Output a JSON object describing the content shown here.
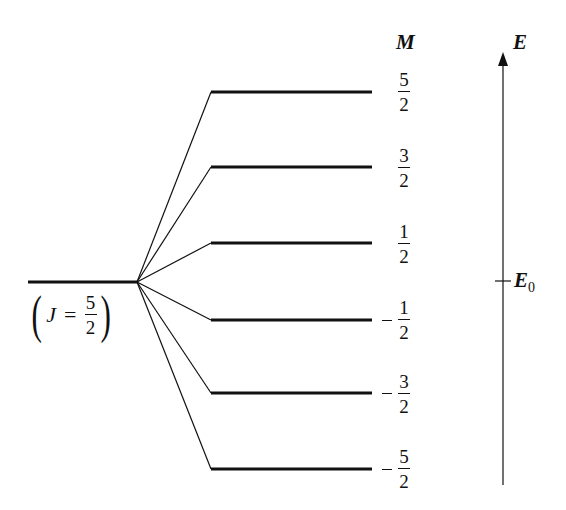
{
  "diagram": {
    "type": "energy-level-splitting",
    "colors": {
      "ink": "#111111",
      "background": "#ffffff"
    },
    "unsplit_level": {
      "label_symbol": "J",
      "label_equals": "=",
      "label_value": {
        "numerator": "5",
        "denominator": "2"
      }
    },
    "column_header": "M",
    "levels": [
      {
        "sign": "",
        "numerator": "5",
        "denominator": "2",
        "y": 92
      },
      {
        "sign": "",
        "numerator": "3",
        "denominator": "2",
        "y": 167
      },
      {
        "sign": "",
        "numerator": "1",
        "denominator": "2",
        "y": 243
      },
      {
        "sign": "−",
        "numerator": "1",
        "denominator": "2",
        "y": 320
      },
      {
        "sign": "−",
        "numerator": "3",
        "denominator": "2",
        "y": 393
      },
      {
        "sign": "−",
        "numerator": "5",
        "denominator": "2",
        "y": 469
      }
    ],
    "energy_axis": {
      "label": "E",
      "reference_label": "E",
      "reference_subscript": "0"
    }
  }
}
